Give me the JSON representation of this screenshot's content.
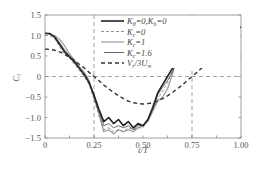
{
  "chart_data": {
    "type": "line",
    "title": "",
    "xlabel": "t/T",
    "ylabel": "C_l",
    "xlim": [
      0,
      1
    ],
    "ylim": [
      -1.5,
      1.5
    ],
    "xticks": [
      "0",
      "0.25",
      "0.50",
      "0.75",
      "1.00"
    ],
    "yticks": [
      "1.5",
      "1.0",
      "0.5",
      "0",
      "−0.5",
      "−1.0",
      "−1.5"
    ],
    "reference_lines": {
      "horizontal": [
        0
      ],
      "vertical": [
        0.25,
        0.75
      ],
      "style": "dashed"
    },
    "grid": false,
    "legend_position": "upper right (inside)",
    "x": [
      0,
      0.025,
      0.05,
      0.075,
      0.1,
      0.125,
      0.15,
      0.175,
      0.2,
      0.225,
      0.25,
      0.275,
      0.3,
      0.325,
      0.35,
      0.375,
      0.4,
      0.425,
      0.45,
      0.475,
      0.5,
      0.525,
      0.55,
      0.575,
      0.6,
      0.625,
      0.65,
      0.675,
      0.7,
      0.725,
      0.75,
      0.775,
      0.8,
      0.825,
      0.85,
      0.875,
      0.9,
      0.925,
      0.95,
      0.975,
      1.0
    ],
    "series": [
      {
        "name": "Kθ=0, Kh=0",
        "style": "thick-solid",
        "color": "#222222",
        "values": [
          1.05,
          1.05,
          0.95,
          0.78,
          0.6,
          0.48,
          0.35,
          0.2,
          0.05,
          -0.15,
          -0.45,
          -0.8,
          -1.1,
          -1.0,
          -1.15,
          -1.05,
          -1.2,
          -1.1,
          -1.25,
          -1.15,
          -1.2,
          -1.05,
          -0.75,
          -0.4,
          -0.2,
          0.0,
          0.2,
          0.55,
          0.75,
          0.85,
          0.9,
          1.05,
          1.15,
          1.2,
          1.25,
          1.2,
          1.25,
          1.2,
          1.22,
          1.18,
          1.2
        ]
      },
      {
        "name": "Kc=0",
        "style": "thin-dashed",
        "color": "#777777",
        "values": [
          1.0,
          1.0,
          0.92,
          0.72,
          0.55,
          0.45,
          0.3,
          0.15,
          0.0,
          -0.2,
          -0.55,
          -0.95,
          -1.3,
          -1.25,
          -1.35,
          -1.3,
          -1.35,
          -1.25,
          -1.3,
          -1.25,
          -1.25,
          -1.05,
          -0.8,
          -0.55,
          -0.35,
          -0.15,
          0.15,
          0.55,
          0.85,
          1.0,
          1.05,
          1.15,
          1.2,
          1.22,
          1.25,
          1.2,
          1.22,
          1.2,
          1.2,
          1.18,
          1.2
        ]
      },
      {
        "name": "Kc=1",
        "style": "gray-solid",
        "color": "#999999",
        "values": [
          1.08,
          1.02,
          1.0,
          0.9,
          0.75,
          0.55,
          0.4,
          0.25,
          0.1,
          -0.1,
          -0.5,
          -0.9,
          -1.35,
          -1.3,
          -1.4,
          -1.3,
          -1.35,
          -1.3,
          -1.35,
          -1.25,
          -1.2,
          -1.1,
          -0.85,
          -0.6,
          -0.5,
          -0.3,
          0.05,
          0.5,
          0.85,
          1.05,
          1.1,
          1.15,
          1.25,
          1.3,
          1.25,
          1.2,
          1.25,
          1.2,
          1.2,
          1.18,
          1.2
        ]
      },
      {
        "name": "Kc=1.6",
        "style": "thin-solid",
        "color": "#444444",
        "values": [
          1.05,
          1.05,
          0.98,
          0.82,
          0.65,
          0.5,
          0.38,
          0.2,
          0.05,
          -0.15,
          -0.5,
          -0.85,
          -1.2,
          -1.15,
          -1.25,
          -1.2,
          -1.25,
          -1.2,
          -1.3,
          -1.2,
          -1.2,
          -1.05,
          -0.8,
          -0.45,
          -0.25,
          -0.1,
          0.1,
          0.5,
          0.8,
          0.95,
          1.0,
          1.1,
          1.2,
          1.25,
          1.3,
          1.22,
          1.25,
          1.2,
          1.22,
          1.18,
          1.2
        ]
      },
      {
        "name": "Vr/3U∞",
        "style": "thick-dashed",
        "color": "#333333",
        "values": [
          0.67,
          0.66,
          0.64,
          0.6,
          0.54,
          0.47,
          0.39,
          0.3,
          0.21,
          0.1,
          0.0,
          -0.1,
          -0.21,
          -0.3,
          -0.39,
          -0.47,
          -0.54,
          -0.6,
          -0.64,
          -0.66,
          -0.67,
          -0.66,
          -0.64,
          -0.6,
          -0.54,
          -0.47,
          -0.39,
          -0.3,
          -0.21,
          -0.1,
          0.0,
          0.1,
          0.21,
          0.3,
          0.39,
          0.47,
          0.54,
          0.6,
          0.64,
          0.66,
          0.67
        ]
      }
    ]
  },
  "legend": {
    "items": [
      {
        "main": "K",
        "sub1": "θ",
        "mid": "=0,K",
        "sub2": "h",
        "tail": "=0"
      },
      {
        "main": "K",
        "sub1": "c",
        "mid": "=0",
        "sub2": "",
        "tail": ""
      },
      {
        "main": "K",
        "sub1": "c",
        "mid": "=1",
        "sub2": "",
        "tail": ""
      },
      {
        "main": "K",
        "sub1": "c",
        "mid": "=1.6",
        "sub2": "",
        "tail": ""
      },
      {
        "main": "V",
        "sub1": "r",
        "mid": "/3U",
        "sub2": "∞",
        "tail": ""
      }
    ]
  },
  "axes": {
    "ylabel_main": "C",
    "ylabel_sub": "l",
    "xlabel": "t/T"
  }
}
